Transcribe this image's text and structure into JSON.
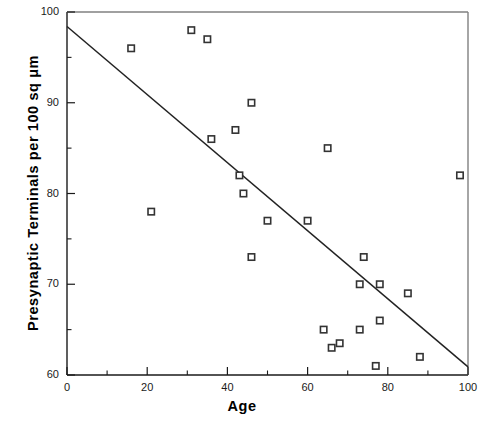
{
  "chart_data": {
    "type": "scatter",
    "title": "",
    "xlabel": "Age",
    "ylabel": "Presynaptic  Terminals  per  100  sq  μm",
    "xlim": [
      0,
      100
    ],
    "ylim": [
      60,
      100
    ],
    "grid": false,
    "legend": null,
    "x_major_ticks": [
      0,
      20,
      40,
      60,
      80,
      100
    ],
    "x_minor_ticks": [
      10,
      30,
      50,
      70,
      90
    ],
    "y_major_ticks": [
      60,
      70,
      80,
      90,
      100
    ],
    "y_minor_ticks": [
      65,
      75,
      85,
      95
    ],
    "x_tick_labels": [
      "0",
      "20",
      "40",
      "60",
      "80",
      "100"
    ],
    "y_tick_labels": [
      "60",
      "70",
      "80",
      "90",
      "100"
    ],
    "marker": "open-square",
    "marker_color": "#333333",
    "series": [
      {
        "name": "Presynaptic terminal density vs age",
        "points": [
          {
            "x": 16,
            "y": 96
          },
          {
            "x": 21,
            "y": 78
          },
          {
            "x": 31,
            "y": 98
          },
          {
            "x": 35,
            "y": 97
          },
          {
            "x": 36,
            "y": 86
          },
          {
            "x": 42,
            "y": 87
          },
          {
            "x": 43,
            "y": 82
          },
          {
            "x": 44,
            "y": 80
          },
          {
            "x": 46,
            "y": 90
          },
          {
            "x": 46,
            "y": 73
          },
          {
            "x": 50,
            "y": 77
          },
          {
            "x": 60,
            "y": 77
          },
          {
            "x": 65,
            "y": 85
          },
          {
            "x": 64,
            "y": 65
          },
          {
            "x": 66,
            "y": 63
          },
          {
            "x": 68,
            "y": 63.5
          },
          {
            "x": 73,
            "y": 70
          },
          {
            "x": 73,
            "y": 65
          },
          {
            "x": 74,
            "y": 73
          },
          {
            "x": 77,
            "y": 61
          },
          {
            "x": 78,
            "y": 70
          },
          {
            "x": 78,
            "y": 66
          },
          {
            "x": 85,
            "y": 69
          },
          {
            "x": 88,
            "y": 62
          },
          {
            "x": 98,
            "y": 82
          }
        ]
      }
    ],
    "trendline": {
      "type": "linear-fit",
      "x_start": 0,
      "y_start": 98.4,
      "x_end": 100,
      "y_end": 60.9
    }
  },
  "axes": {
    "plot_left_px": 67,
    "plot_right_px": 468,
    "plot_top_px": 12,
    "plot_bottom_px": 375
  }
}
